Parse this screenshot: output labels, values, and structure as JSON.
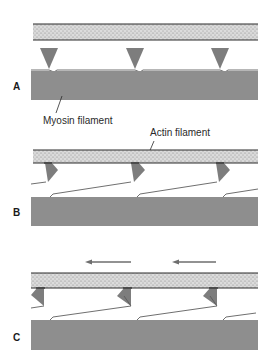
{
  "figure": {
    "type": "sliding-filament-diagram",
    "colors": {
      "actin_fill": "#d9d9d9",
      "actin_stipple": "#8c8c8c",
      "actin_edge": "#2b2b2b",
      "myosin_fill": "#8e8e8e",
      "head_fill": "#7d7d7d",
      "arrow": "#6e6e6e",
      "line": "#3a3a3a"
    },
    "labels": {
      "myosin": "Myosin filament",
      "actin": "Actin filament"
    },
    "panels": [
      {
        "id": "A",
        "letter": "A",
        "state": "heads attached, perpendicular"
      },
      {
        "id": "B",
        "letter": "B",
        "state": "heads bound, angled (power stroke begins)"
      },
      {
        "id": "C",
        "letter": "C",
        "state": "heads pivoted, actin slides left",
        "arrows": [
          "left",
          "left"
        ]
      }
    ]
  }
}
